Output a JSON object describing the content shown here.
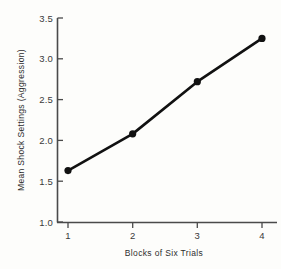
{
  "chart_data": {
    "type": "line",
    "title": "",
    "xlabel": "Blocks of Six Trials",
    "ylabel": "Mean Shock Settings (Aggression)",
    "categories": [
      "1",
      "2",
      "3",
      "4"
    ],
    "x": [
      1,
      2,
      3,
      4
    ],
    "values": [
      1.63,
      2.08,
      2.72,
      3.25
    ],
    "series": [
      {
        "name": "Mean Shock Settings",
        "values": [
          1.63,
          2.08,
          2.72,
          3.25
        ]
      }
    ],
    "xlim": [
      0.6,
      4.35
    ],
    "ylim": [
      1.0,
      3.5
    ],
    "yticks": [
      1.0,
      1.5,
      2.0,
      2.5,
      3.0,
      3.5
    ],
    "ytick_labels": [
      "1.0",
      "1.5",
      "2.0",
      "2.5",
      "3.0",
      "3.5"
    ],
    "xticks": [
      1,
      2,
      3,
      4
    ],
    "xtick_labels": [
      "1",
      "2",
      "3",
      "4"
    ],
    "grid": false,
    "legend": false,
    "legend_position": "none",
    "marker": "filled-circle",
    "line_color": "#111111",
    "marker_color": "#111111",
    "axis_color": "#4a4a4a",
    "background_color": "#fdfdfb"
  },
  "labels": {
    "y_title": "Mean Shock Settings (Aggression)",
    "x_title": "Blocks of Six Trials",
    "y_tick_0": "1.0",
    "y_tick_1": "1.5",
    "y_tick_2": "2.0",
    "y_tick_3": "2.5",
    "y_tick_4": "3.0",
    "y_tick_5": "3.5",
    "x_tick_0": "1",
    "x_tick_1": "2",
    "x_tick_2": "3",
    "x_tick_3": "4"
  }
}
